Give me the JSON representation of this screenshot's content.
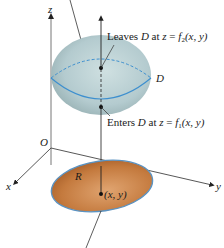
{
  "figure": {
    "axes": {
      "z_label": "z",
      "x_label": "x",
      "y_label": "y",
      "origin_label": "O"
    },
    "solid": {
      "label": "D",
      "color": "#b9cfd3",
      "edge_color": "#3d8fcf"
    },
    "region": {
      "label": "R",
      "color": "#c0793e",
      "edge_color": "#5b93c2"
    },
    "annotations": {
      "leaves_prefix": "Leaves ",
      "leaves_D": "D",
      "leaves_mid": " at ",
      "leaves_z": "z",
      "leaves_eq": " = ",
      "leaves_f": "f",
      "leaves_sub": "2",
      "leaves_args": "(x,  y)",
      "enters_prefix": "Enters ",
      "enters_D": "D",
      "enters_mid": " at ",
      "enters_z": "z",
      "enters_eq": " = ",
      "enters_f": "f",
      "enters_sub": "1",
      "enters_args": "(x,  y)",
      "point_label": "(x,  y)"
    }
  }
}
